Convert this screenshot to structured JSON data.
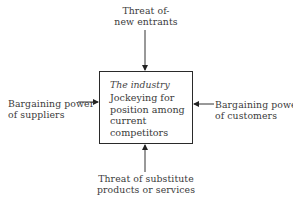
{
  "diagram": {
    "center": {
      "title": "The industry",
      "text": "Jockeying for position among current competitors"
    },
    "forces": {
      "top": {
        "line1": "Threat of-",
        "line2": "new entrants"
      },
      "left": {
        "line1": "Bargaining power",
        "line2": "of suppliers"
      },
      "right": {
        "line1": "Bargaining power",
        "line2": "of customers"
      },
      "bottom": {
        "line1": "Threat of substitute",
        "line2": "products or services"
      }
    }
  }
}
